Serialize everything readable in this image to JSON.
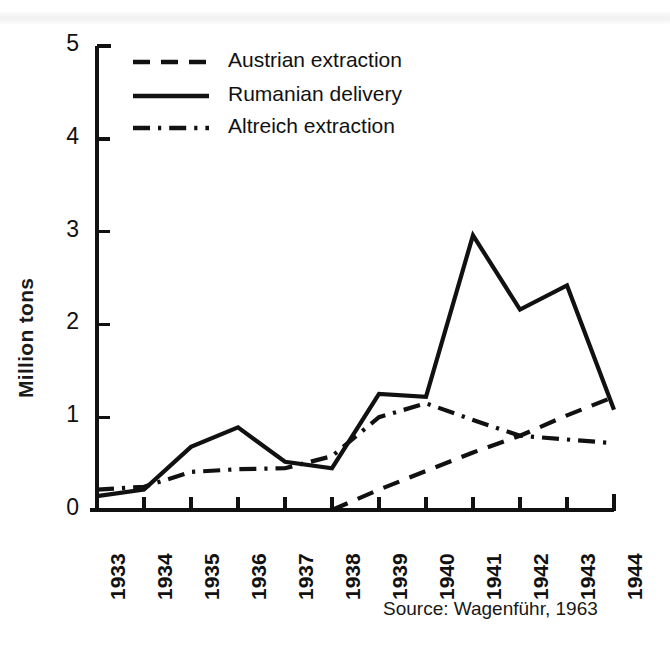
{
  "chart_data": {
    "type": "line",
    "title": "",
    "subtitle": "",
    "xlabel": "",
    "ylabel": "Million tons",
    "categories": [
      "1933",
      "1934",
      "1935",
      "1936",
      "1937",
      "1938",
      "1939",
      "1940",
      "1941",
      "1942",
      "1943",
      "1944"
    ],
    "x": [
      1933,
      1934,
      1935,
      1936,
      1937,
      1938,
      1939,
      1940,
      1941,
      1942,
      1943,
      1944
    ],
    "xlim": [
      1933,
      1944
    ],
    "ylim": [
      0,
      5
    ],
    "yticks": [
      0,
      1,
      2,
      3,
      4,
      5
    ],
    "ytick_labels": [
      "0",
      "1",
      "2",
      "3",
      "4",
      "5"
    ],
    "grid": false,
    "legend_position": "top-left",
    "series": [
      {
        "name": "Austrian extraction",
        "style": "dashed",
        "color": "#111111",
        "x": [
          1938,
          1939,
          1940,
          1941,
          1942,
          1943,
          1944
        ],
        "values": [
          0.0,
          0.22,
          0.42,
          0.62,
          0.8,
          1.02,
          1.22
        ]
      },
      {
        "name": "Rumanian delivery",
        "style": "solid",
        "color": "#111111",
        "x": [
          1933,
          1934,
          1935,
          1936,
          1937,
          1938,
          1939,
          1940,
          1941,
          1942,
          1943,
          1944
        ],
        "values": [
          0.15,
          0.22,
          0.68,
          0.89,
          0.52,
          0.45,
          1.25,
          1.22,
          2.96,
          2.16,
          2.42,
          1.08
        ]
      },
      {
        "name": "Altreich extraction",
        "style": "dash-dot",
        "color": "#111111",
        "x": [
          1933,
          1934,
          1935,
          1936,
          1937,
          1938,
          1939,
          1940,
          1941,
          1942,
          1943,
          1944
        ],
        "values": [
          0.22,
          0.25,
          0.41,
          0.44,
          0.45,
          0.58,
          1.0,
          1.15,
          0.97,
          0.8,
          0.76,
          0.72
        ]
      }
    ],
    "annotations": [
      {
        "name": "source",
        "text": "Source: Wagenführ, 1963"
      }
    ]
  },
  "legend": {
    "items": [
      {
        "label": "Austrian extraction",
        "style": "dashed"
      },
      {
        "label": "Rumanian delivery",
        "style": "solid"
      },
      {
        "label": "Altreich extraction",
        "style": "dash-dot"
      }
    ]
  },
  "axes": {
    "y_axis_label": "Million tons",
    "y_ticks": [
      "5",
      "4",
      "3",
      "2",
      "1",
      "0"
    ],
    "x_ticks": [
      "1933",
      "1934",
      "1935",
      "1936",
      "1937",
      "1938",
      "1939",
      "1940",
      "1941",
      "1942",
      "1943",
      "1944"
    ]
  },
  "source": {
    "text": "Source: Wagenführ, 1963"
  },
  "colors": {
    "ink": "#111111",
    "background": "#ffffff"
  }
}
